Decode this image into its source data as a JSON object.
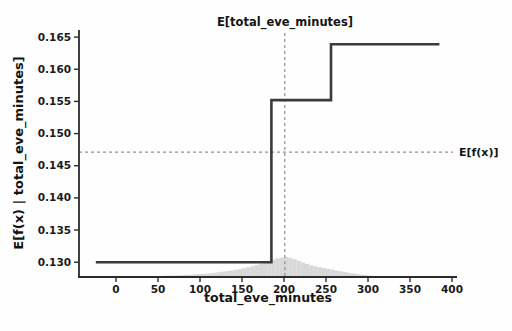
{
  "figure": {
    "kind": "shap-partial-dependence-plot"
  },
  "chart_data": {
    "type": "line",
    "title": "E[total_eve_minutes]",
    "xlabel": "total_eve_minutes",
    "ylabel": "E[f(x) | total_eve_minutes]",
    "annotations": {
      "expected_x_label": "E[total_eve_minutes]",
      "expected_fx_label": "E[f(x)]"
    },
    "x_ticks": [
      0,
      50,
      100,
      150,
      200,
      250,
      300,
      350,
      400
    ],
    "y_ticks": [
      0.13,
      0.135,
      0.14,
      0.145,
      0.15,
      0.155,
      0.16,
      0.165
    ],
    "xlim": [
      -44,
      406
    ],
    "ylim": [
      0.1277,
      0.1661
    ],
    "grid": false,
    "legend": null,
    "step_line": {
      "x": [
        -24,
        185,
        185,
        256,
        256,
        385
      ],
      "y": [
        0.13,
        0.13,
        0.1552,
        0.1552,
        0.1639,
        0.1639
      ]
    },
    "expected_x": 201,
    "expected_fx": 0.1471,
    "histogram": {
      "bin_start": 45,
      "bin_width": 5,
      "peak_height_px": 20,
      "heights_normalized": [
        0.05,
        0.05,
        0.06,
        0.07,
        0.07,
        0.08,
        0.09,
        0.1,
        0.11,
        0.12,
        0.14,
        0.15,
        0.17,
        0.19,
        0.21,
        0.24,
        0.27,
        0.3,
        0.33,
        0.36,
        0.4,
        0.44,
        0.49,
        0.54,
        0.6,
        0.66,
        0.73,
        0.8,
        0.87,
        0.93,
        0.97,
        1.0,
        0.96,
        0.89,
        0.8,
        0.72,
        0.65,
        0.59,
        0.54,
        0.49,
        0.45,
        0.41,
        0.37,
        0.33,
        0.29,
        0.25,
        0.21,
        0.18,
        0.15,
        0.12,
        0.09,
        0.07,
        0.05,
        0.04,
        0.03
      ]
    },
    "colors": {
      "step_line": "#3b3b3b",
      "dashed_reference": "#8f8f8f",
      "histogram": "#d8d8d8",
      "axis": "#2b2b2b",
      "text": "#141414",
      "background": "#fefefe"
    }
  }
}
